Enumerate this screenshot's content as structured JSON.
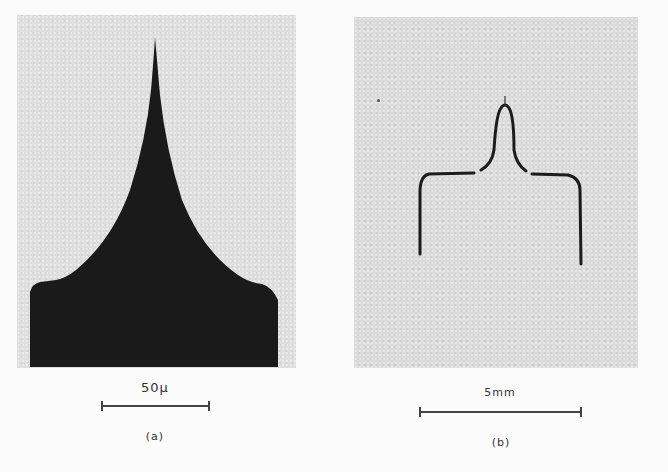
{
  "figure": {
    "panels": [
      {
        "id": "a",
        "label": "(a)",
        "subject": "sharpened-tip-micrograph",
        "scale_bar": {
          "label": "50μ"
        }
      },
      {
        "id": "b",
        "label": "(b)",
        "subject": "hairpin-wire-tip",
        "scale_bar": {
          "label": "5mm"
        }
      }
    ],
    "colors": {
      "photo_background": "#dedede",
      "specimen": "#1a1a1a",
      "page": "#fbfbfb",
      "text": "#333333"
    }
  }
}
